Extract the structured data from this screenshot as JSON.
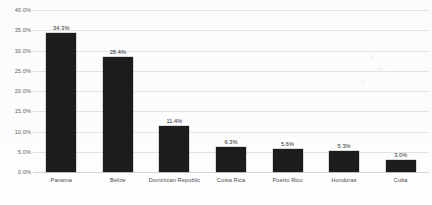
{
  "chart_data": {
    "type": "bar",
    "title": "",
    "subtitle": "",
    "xlabel": "",
    "ylabel": "",
    "categories": [
      "Panama",
      "Belize",
      "Dominican Republic",
      "Costa Rica",
      "Puerto Rico",
      "Honduras",
      "Cuba"
    ],
    "values": [
      34.3,
      28.4,
      11.4,
      6.3,
      5.6,
      5.3,
      3.0
    ],
    "data_labels": [
      "34.3%",
      "28.4%",
      "11.4%",
      "6.3%",
      "5.6%",
      "5.3%",
      "3.0%"
    ],
    "ylim": [
      0,
      40
    ],
    "ytick_values": [
      0,
      5,
      10,
      15,
      20,
      25,
      30,
      35,
      40
    ],
    "ytick_labels": [
      "0.0%",
      "5.0%",
      "10.0%",
      "15.0%",
      "20.0%",
      "25.0%",
      "30.0%",
      "35.0%",
      "40.0%"
    ],
    "grid": true,
    "legend": false,
    "legend_position": "none",
    "bar_color": "#1c1c1c",
    "gridline_color": "#e2e2e2",
    "background_color": "#fdfdfd",
    "text_color": "#4a4a4a"
  }
}
